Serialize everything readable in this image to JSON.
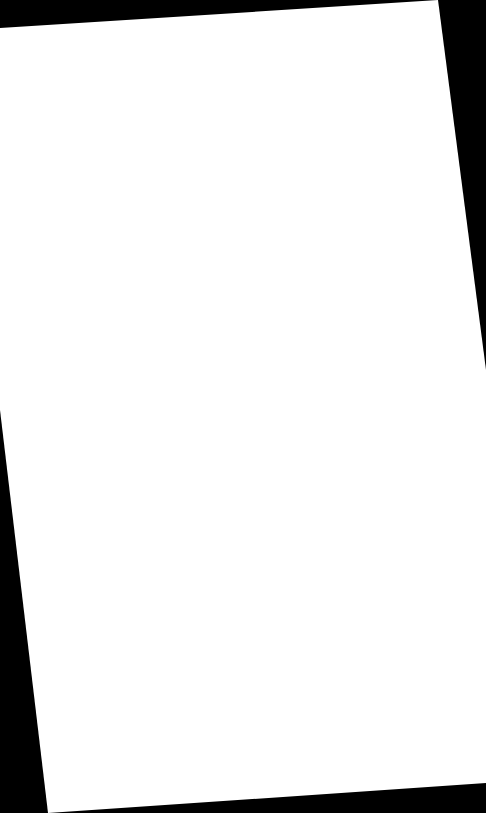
{
  "scene": {
    "description": "Blank white sheet of paper, slightly rotated, on a black background",
    "background_color": "#000000",
    "paper_color": "#ffffff",
    "paper_points": "0,28 438,0 486,370 486,783 48,813 0,410"
  }
}
